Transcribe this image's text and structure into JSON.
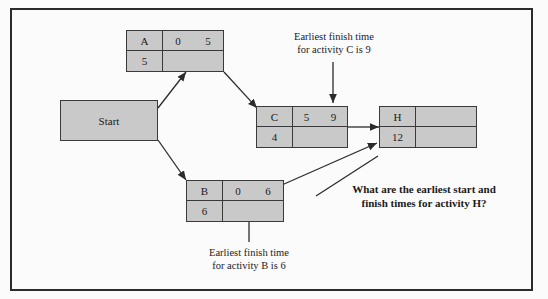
{
  "diagram": {
    "frame": {
      "border_color": "#2b2b2b"
    },
    "node_fill": "#c9c9c9",
    "node_border": "#3a3a3a",
    "start": {
      "label": "Start"
    },
    "nodes": [
      {
        "id": "A",
        "label": "A",
        "earliest_start": "0",
        "earliest_finish": "5",
        "duration": "5",
        "spare": ""
      },
      {
        "id": "C",
        "label": "C",
        "earliest_start": "5",
        "earliest_finish": "9",
        "duration": "4",
        "spare": ""
      },
      {
        "id": "H",
        "label": "H",
        "earliest_start": "",
        "earliest_finish": "",
        "duration": "12",
        "spare": ""
      },
      {
        "id": "B",
        "label": "B",
        "earliest_start": "0",
        "earliest_finish": "6",
        "duration": "6",
        "spare": ""
      }
    ],
    "annotations": {
      "c_note_line1": "Earliest finish time",
      "c_note_line2": "for activity C is 9",
      "b_note_line1": "Earliest finish time",
      "b_note_line2": "for activity B is 6",
      "h_question_line1": "What are the earliest start and",
      "h_question_line2": "finish times for activity H?"
    },
    "edges": [
      {
        "from": "Start",
        "to": "A"
      },
      {
        "from": "Start",
        "to": "B"
      },
      {
        "from": "A",
        "to": "C"
      },
      {
        "from": "C",
        "to": "H"
      },
      {
        "from": "B",
        "to": "H"
      }
    ]
  }
}
